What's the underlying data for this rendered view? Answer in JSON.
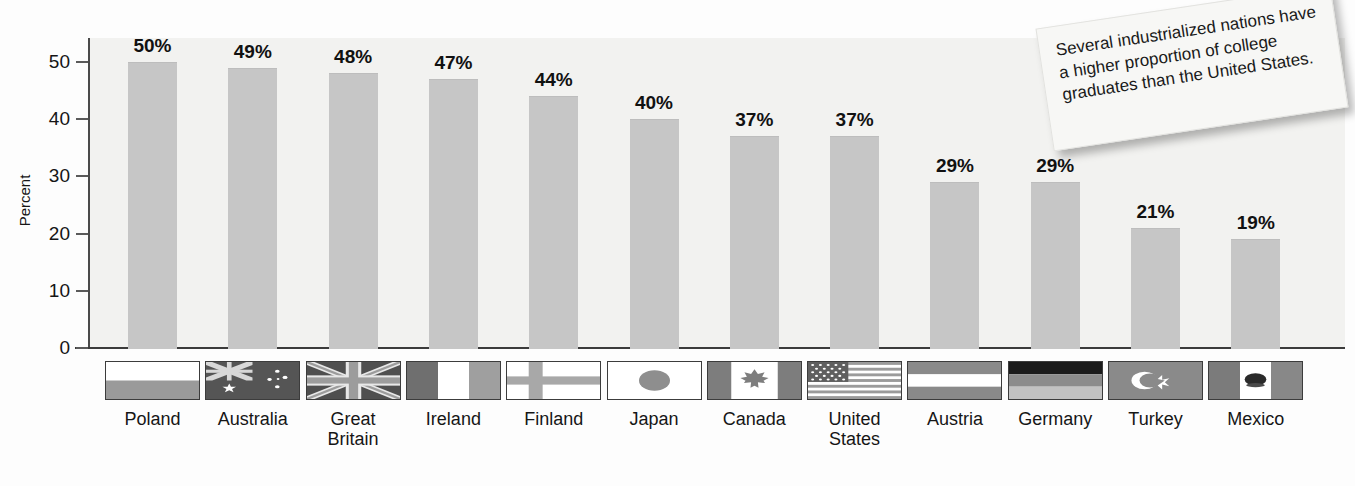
{
  "chart_data": {
    "type": "bar",
    "title": "",
    "xlabel": "",
    "ylabel": "Percent",
    "ylim": [
      0,
      55
    ],
    "yticks": [
      0,
      10,
      20,
      30,
      40,
      50
    ],
    "grid": false,
    "legend": "none",
    "categories": [
      "Poland",
      "Australia",
      "Great Britain",
      "Ireland",
      "Finland",
      "Japan",
      "Canada",
      "United States",
      "Austria",
      "Germany",
      "Turkey",
      "Mexico"
    ],
    "values": [
      50,
      49,
      48,
      47,
      44,
      40,
      37,
      37,
      29,
      29,
      21,
      19
    ],
    "value_labels": [
      "50%",
      "49%",
      "48%",
      "47%",
      "44%",
      "40%",
      "37%",
      "37%",
      "29%",
      "29%",
      "21%",
      "19%"
    ],
    "bar_color": "#c6c6c6",
    "plot_background": "#f2f2f0"
  },
  "axis": {
    "y_label": "Percent",
    "y_ticks": [
      {
        "value": 50,
        "label": "50"
      },
      {
        "value": 40,
        "label": "40"
      },
      {
        "value": 30,
        "label": "30"
      },
      {
        "value": 20,
        "label": "20"
      },
      {
        "value": 10,
        "label": "10"
      },
      {
        "value": 0,
        "label": "0"
      }
    ]
  },
  "countries": [
    {
      "name": "Poland",
      "label_line1": "Poland",
      "label_line2": "",
      "value_label": "50%",
      "value": 50,
      "flag": "poland-flag"
    },
    {
      "name": "Australia",
      "label_line1": "Australia",
      "label_line2": "",
      "value_label": "49%",
      "value": 49,
      "flag": "australia-flag"
    },
    {
      "name": "Great Britain",
      "label_line1": "Great",
      "label_line2": "Britain",
      "value_label": "48%",
      "value": 48,
      "flag": "great-britain-flag"
    },
    {
      "name": "Ireland",
      "label_line1": "Ireland",
      "label_line2": "",
      "value_label": "47%",
      "value": 47,
      "flag": "ireland-flag"
    },
    {
      "name": "Finland",
      "label_line1": "Finland",
      "label_line2": "",
      "value_label": "44%",
      "value": 44,
      "flag": "finland-flag"
    },
    {
      "name": "Japan",
      "label_line1": "Japan",
      "label_line2": "",
      "value_label": "40%",
      "value": 40,
      "flag": "japan-flag"
    },
    {
      "name": "Canada",
      "label_line1": "Canada",
      "label_line2": "",
      "value_label": "37%",
      "value": 37,
      "flag": "canada-flag"
    },
    {
      "name": "United States",
      "label_line1": "United",
      "label_line2": "States",
      "value_label": "37%",
      "value": 37,
      "flag": "united-states-flag"
    },
    {
      "name": "Austria",
      "label_line1": "Austria",
      "label_line2": "",
      "value_label": "29%",
      "value": 29,
      "flag": "austria-flag"
    },
    {
      "name": "Germany",
      "label_line1": "Germany",
      "label_line2": "",
      "value_label": "29%",
      "value": 29,
      "flag": "germany-flag"
    },
    {
      "name": "Turkey",
      "label_line1": "Turkey",
      "label_line2": "",
      "value_label": "21%",
      "value": 21,
      "flag": "turkey-flag"
    },
    {
      "name": "Mexico",
      "label_line1": "Mexico",
      "label_line2": "",
      "value_label": "19%",
      "value": 19,
      "flag": "mexico-flag"
    }
  ],
  "callout": {
    "text": "Several industrialized nations have a higher proportion of college graduates than the United States."
  }
}
